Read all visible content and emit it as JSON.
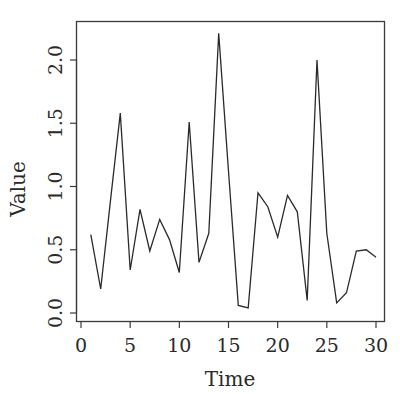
{
  "chart_data": {
    "type": "line",
    "title": "",
    "xlabel": "Time",
    "ylabel": "Value",
    "xlim": [
      0,
      30
    ],
    "ylim": [
      0,
      2.2
    ],
    "x_ticks": [
      0,
      5,
      10,
      15,
      20,
      25,
      30
    ],
    "x_tick_labels": [
      "0",
      "5",
      "10",
      "15",
      "20",
      "25",
      "30"
    ],
    "y_ticks": [
      0.0,
      0.5,
      1.0,
      1.5,
      2.0
    ],
    "y_tick_labels": [
      "0.0",
      "0.5",
      "1.0",
      "1.5",
      "2.0"
    ],
    "grid": false,
    "legend": null,
    "series": [
      {
        "name": "Value",
        "color": "#2a2a2a",
        "x": [
          1,
          2,
          3,
          4,
          5,
          6,
          7,
          8,
          9,
          10,
          11,
          12,
          13,
          14,
          15,
          16,
          17,
          18,
          19,
          20,
          21,
          22,
          23,
          24,
          25,
          26,
          27,
          28,
          29,
          30
        ],
        "values": [
          0.62,
          0.19,
          0.89,
          1.58,
          0.34,
          0.82,
          0.49,
          0.74,
          0.58,
          0.32,
          1.51,
          0.4,
          0.63,
          2.21,
          1.12,
          0.06,
          0.04,
          0.95,
          0.84,
          0.6,
          0.93,
          0.8,
          0.1,
          2.0,
          0.63,
          0.08,
          0.16,
          0.49,
          0.5,
          0.44
        ]
      }
    ]
  },
  "colors": {
    "axis": "#3a3a3a",
    "line": "#2a2a2a",
    "background": "#ffffff"
  }
}
